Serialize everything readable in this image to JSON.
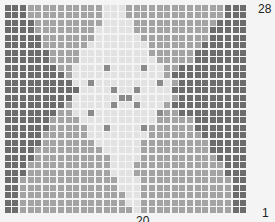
{
  "chart_data": {
    "type": "heatmap",
    "title": "",
    "columns": 32,
    "rows": 28,
    "palette": {
      "0": "#6c6c6c",
      "1": "#a3a3a3",
      "2": "#e2e2e2",
      "3": "#8a8a8a"
    },
    "y_tick_labels": {
      "top": "28",
      "bottom": "1"
    },
    "x_tick_labels": {
      "center": "20"
    },
    "grid": [
      "00011111111112221111111111111000",
      "00011111111112221111111111111000",
      "00001111111112222111111111110000",
      "00001111111122222111111111100000",
      "00000111111122222211111111100000",
      "00000111111222222221111111000000",
      "00000011112222222221111110000000",
      "00000011112222222222111110000000",
      "00000001122222222222211000000000",
      "00000000122222222222210000000000",
      "00000000022222222222221000000000",
      "00000000002222222222220000000000",
      "00000000022222222222221000000000",
      "00000000122222222222210000000000",
      "00000001122222222222211000000000",
      "00000011112222222222111110000000",
      "00000011111222222221111110000000",
      "00000111111222222221111111000000",
      "00000111111122222211111111100000",
      "00001111111112222211111111100000",
      "00001111111111222211111111110000",
      "00011111111111222111111111111000",
      "00011111111111222111111111111000",
      "00111111111111122211111111111100",
      "00111111111111122211111111111100",
      "00111111111111112211111111111100",
      "00111111111111112211111111111100",
      "00111111111111111211111111111100"
    ],
    "dots": [
      [
        8,
        13
      ],
      [
        8,
        18
      ],
      [
        12,
        15
      ],
      [
        12,
        16
      ],
      [
        16,
        13
      ],
      [
        16,
        18
      ],
      [
        10,
        11
      ],
      [
        10,
        20
      ],
      [
        14,
        11
      ],
      [
        14,
        20
      ],
      [
        11,
        14
      ],
      [
        11,
        17
      ],
      [
        13,
        14
      ],
      [
        13,
        17
      ]
    ]
  },
  "labels": {
    "top": "28",
    "bottom": "1",
    "x": "20"
  }
}
